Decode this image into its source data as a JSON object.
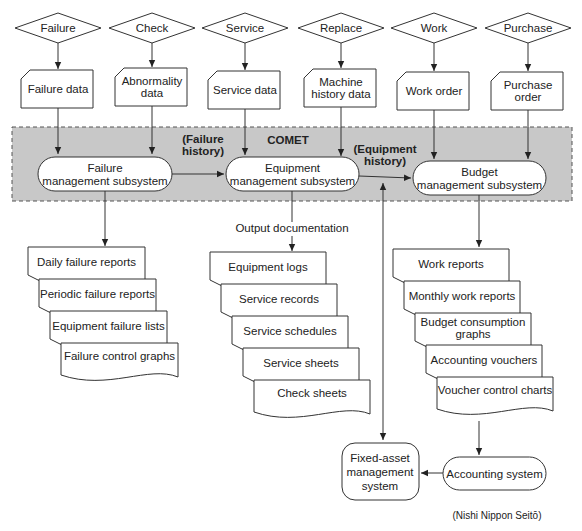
{
  "diagram": {
    "band_label": "COMET",
    "band_color": "#c8c8c8",
    "triggers": [
      {
        "label": "Failure"
      },
      {
        "label": "Check"
      },
      {
        "label": "Service"
      },
      {
        "label": "Replace"
      },
      {
        "label": "Work"
      },
      {
        "label": "Purchase"
      }
    ],
    "inputs": [
      {
        "lines": [
          "Failure data"
        ]
      },
      {
        "lines": [
          "Abnormality",
          "data"
        ]
      },
      {
        "lines": [
          "Service data"
        ]
      },
      {
        "lines": [
          "Machine",
          "history data"
        ]
      },
      {
        "lines": [
          "Work order"
        ]
      },
      {
        "lines": [
          "Purchase",
          "order"
        ]
      }
    ],
    "subsystems": [
      {
        "lines": [
          "Failure",
          "management subsystem"
        ]
      },
      {
        "lines": [
          "Equipment",
          "management subsystem"
        ]
      },
      {
        "lines": [
          "Budget",
          "management subsystem"
        ]
      }
    ],
    "flow_labels": [
      {
        "lines": [
          "(Failure",
          "history)"
        ]
      },
      {
        "lines": [
          "(Equipment",
          "history)"
        ]
      }
    ],
    "output_caption": "Output documentation",
    "outputs": {
      "failure": [
        {
          "lines": [
            "Daily failure reports"
          ]
        },
        {
          "lines": [
            "Periodic failure reports"
          ]
        },
        {
          "lines": [
            "Equipment failure lists"
          ]
        },
        {
          "lines": [
            "Failure control graphs"
          ]
        }
      ],
      "equipment": [
        {
          "lines": [
            "Equipment logs"
          ]
        },
        {
          "lines": [
            "Service records"
          ]
        },
        {
          "lines": [
            "Service schedules"
          ]
        },
        {
          "lines": [
            "Service sheets"
          ]
        },
        {
          "lines": [
            "Check sheets"
          ]
        }
      ],
      "budget": [
        {
          "lines": [
            "Work reports"
          ]
        },
        {
          "lines": [
            "Monthly work reports"
          ]
        },
        {
          "lines": [
            "Budget consumption",
            "graphs"
          ]
        },
        {
          "lines": [
            "Accounting vouchers"
          ]
        },
        {
          "lines": [
            "Voucher control charts"
          ]
        }
      ]
    },
    "fixed_asset": {
      "lines": [
        "Fixed-asset",
        "management",
        "system"
      ]
    },
    "accounting": {
      "lines": [
        "Accounting system"
      ]
    },
    "source_note": "(Nishi Nippon Seitō)"
  }
}
